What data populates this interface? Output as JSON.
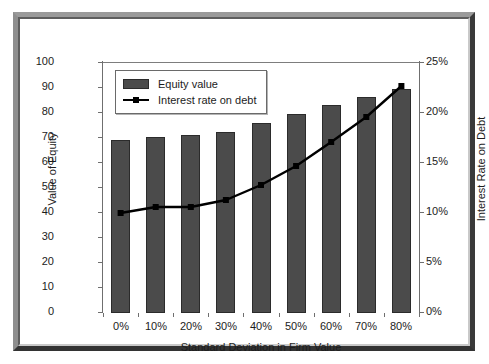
{
  "chart_data": {
    "type": "bar",
    "title": "",
    "xlabel": "Standard Deviation in Firm Value",
    "categories": [
      "0%",
      "10%",
      "20%",
      "30%",
      "40%",
      "50%",
      "60%",
      "70%",
      "80%"
    ],
    "grid": false,
    "legend_position": "top-left-inside",
    "axes": {
      "left": {
        "label": "Value of Equity",
        "ylim": [
          0,
          100
        ],
        "tick_step": 10,
        "ticks": [
          "0",
          "10",
          "20",
          "30",
          "40",
          "50",
          "60",
          "70",
          "80",
          "90",
          "100"
        ]
      },
      "right": {
        "label": "Interest Rate on Debt",
        "ylim": [
          0,
          25
        ],
        "tick_step": 5,
        "ticks": [
          "0%",
          "5%",
          "10%",
          "15%",
          "20%",
          "25%"
        ]
      }
    },
    "series": [
      {
        "name": "Equity value",
        "type": "bar",
        "axis": "left",
        "color": "#4b4b4b",
        "values": [
          69,
          70.5,
          71,
          72.5,
          76,
          79.5,
          83,
          86.5,
          89.5
        ]
      },
      {
        "name": "Interest rate on debt",
        "type": "line",
        "axis": "right",
        "color": "#000000",
        "marker": "square",
        "values": [
          10.0,
          10.6,
          10.6,
          11.3,
          12.8,
          14.7,
          17.1,
          19.6,
          22.7
        ]
      }
    ]
  },
  "legend": {
    "items": [
      {
        "label": "Equity value"
      },
      {
        "label": "Interest rate on debt"
      }
    ]
  },
  "colors": {
    "bar_fill": "#4b4b4b",
    "bar_edge": "#2b2b2b",
    "line": "#000000",
    "axis": "#6f6f6f",
    "text": "#1c1c1c",
    "frame_light": "#9a9a9a",
    "frame_dark": "#333333",
    "background": "#ffffff"
  }
}
